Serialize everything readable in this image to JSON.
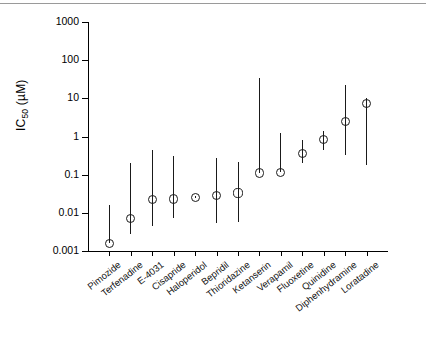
{
  "chart_data": {
    "type": "scatter",
    "title": "",
    "xlabel": "",
    "ylabel": "IC50 (µM)",
    "ylabel_base": "IC",
    "ylabel_sub": "50",
    "ylabel_unit": " (µM)",
    "yscale": "log",
    "ylim": [
      0.001,
      1000
    ],
    "ytick_labels": [
      "1000",
      "100",
      "10",
      "1",
      "0.1",
      "0.01",
      "0.001"
    ],
    "ytick_values": [
      1000,
      100,
      10,
      1,
      0.1,
      0.01,
      0.001
    ],
    "grid": false,
    "legend": "none",
    "categories": [
      "Pimozide",
      "Terfenadine",
      "E-4031",
      "Cisapride",
      "Haloperidol",
      "Bepridil",
      "Thioridazine",
      "Ketanserin",
      "Verapamil",
      "Fluoxetine",
      "Quinidine",
      "Diphenhydramine",
      "Loratadine"
    ],
    "series": [
      {
        "name": "IC50",
        "marker": "open-circle",
        "values": [
          0.0016,
          0.007,
          0.022,
          0.023,
          0.025,
          0.028,
          0.033,
          0.11,
          0.115,
          0.35,
          0.85,
          2.5,
          7.5
        ],
        "low": [
          0.0016,
          0.0028,
          0.0046,
          0.0075,
          0.024,
          0.0055,
          0.0058,
          0.11,
          0.115,
          0.2,
          0.45,
          0.32,
          0.18
        ],
        "high": [
          0.016,
          0.2,
          0.45,
          0.3,
          0.027,
          0.28,
          0.22,
          35,
          1.2,
          0.8,
          1.4,
          22,
          10
        ]
      }
    ]
  },
  "figure": {
    "ink_color": "#1a1a1a",
    "background": "#ffffff",
    "rule_color": "#9a9a9a"
  }
}
